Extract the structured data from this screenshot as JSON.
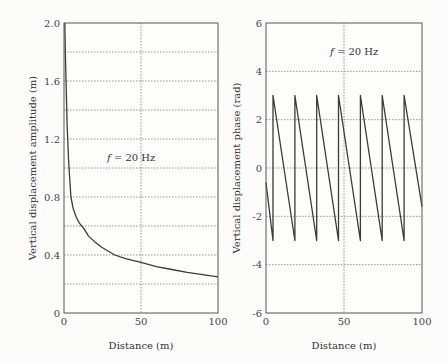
{
  "chart_data": [
    {
      "type": "line",
      "title": "",
      "annotation": "f = 20 Hz",
      "xlabel": "Distance (m)",
      "ylabel": "Vertical displacement amplitude (m)",
      "xlim": [
        0,
        100
      ],
      "ylim": [
        0,
        2.0
      ],
      "xticks": [
        "0",
        "50",
        "100"
      ],
      "yticks": [
        "0",
        "0.4",
        "0.8",
        "1.2",
        "1.6",
        "2.0"
      ],
      "grid": true,
      "series": [
        {
          "name": "amplitude",
          "x": [
            0.5,
            1,
            2,
            3,
            4.5,
            6,
            8,
            10,
            13,
            16,
            20,
            25,
            33,
            40,
            50,
            60,
            70,
            80,
            90,
            100
          ],
          "y": [
            2.0,
            1.75,
            1.3,
            1.05,
            0.8,
            0.72,
            0.66,
            0.62,
            0.58,
            0.53,
            0.49,
            0.45,
            0.4,
            0.375,
            0.35,
            0.32,
            0.3,
            0.28,
            0.265,
            0.25
          ]
        }
      ]
    },
    {
      "type": "line",
      "title": "",
      "annotation": "f = 20 Hz",
      "xlabel": "Distance (m)",
      "ylabel": "Vertical displacement phase (rad)",
      "xlim": [
        0,
        100
      ],
      "ylim": [
        -6,
        6
      ],
      "xticks": [
        "0",
        "50",
        "100"
      ],
      "yticks": [
        "-6",
        "-4",
        "-2",
        "0",
        "2",
        "4",
        "6"
      ],
      "grid": true,
      "series": [
        {
          "name": "phase",
          "x": [
            0,
            4.5,
            4.5,
            18.5,
            18.5,
            32.5,
            32.5,
            46.5,
            46.5,
            60.5,
            60.5,
            74.5,
            74.5,
            88.5,
            88.5,
            100
          ],
          "y": [
            -0.6,
            -3.0,
            3.0,
            -3.0,
            3.0,
            -3.0,
            3.0,
            -3.0,
            3.0,
            -3.0,
            3.0,
            -3.0,
            3.0,
            -3.0,
            3.0,
            -1.6
          ]
        }
      ]
    }
  ]
}
